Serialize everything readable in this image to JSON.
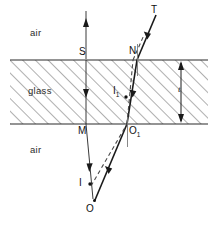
{
  "figure": {
    "media": {
      "upper_label": "air",
      "slab_label": "glass",
      "lower_label": "air"
    },
    "thickness_label": "t",
    "points": [
      {
        "id": "S",
        "label": "S",
        "x": 86,
        "y": 60,
        "label_x": 80,
        "label_y": 49
      },
      {
        "id": "N",
        "label": "N",
        "x": 137,
        "y": 60,
        "label_x": 130,
        "label_y": 48
      },
      {
        "id": "T",
        "label": "T",
        "x": 155,
        "y": 14,
        "label_x": 151,
        "label_y": 8
      },
      {
        "id": "M",
        "label": "M",
        "x": 86,
        "y": 124,
        "label_x": 79,
        "label_y": 127
      },
      {
        "id": "O1",
        "label": "O",
        "sub": "1",
        "x": 127,
        "y": 124,
        "label_x": 129,
        "label_y": 127
      },
      {
        "id": "I1",
        "label": "I",
        "sub": "1",
        "x": 122,
        "y": 97,
        "label_x": 114,
        "label_y": 88
      },
      {
        "id": "I",
        "label": "I",
        "x": 91,
        "y": 184,
        "label_x": 80,
        "label_y": 180
      },
      {
        "id": "O",
        "label": "O",
        "x": 95,
        "y": 201,
        "label_x": 87,
        "label_y": 205
      }
    ],
    "colors": {
      "ink": "#1a1a1a",
      "hatch": "#6e6e6e",
      "boundary": "#2a2a2a",
      "dashed": "#4a4a4a",
      "background": "#ffffff"
    },
    "geometry": {
      "slab_left": 10,
      "slab_right": 208,
      "slab_top": 60,
      "slab_bottom": 124,
      "dimension_x": 181
    }
  }
}
